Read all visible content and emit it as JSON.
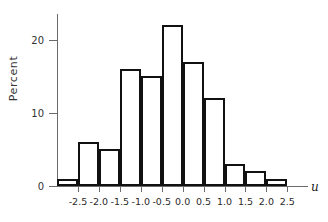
{
  "chart_data": {
    "type": "bar",
    "subtype": "histogram",
    "title": "",
    "xlabel": "u",
    "ylabel": "Percent",
    "categories": [
      "-2.75",
      "-2.25",
      "-1.75",
      "-1.25",
      "-0.75",
      "-0.25",
      "0.25",
      "0.75",
      "1.25",
      "1.75",
      "2.25"
    ],
    "bin_edges": [
      -3.0,
      -2.5,
      -2.0,
      -1.5,
      -1.0,
      -0.5,
      0.0,
      0.5,
      1.0,
      1.5,
      2.0,
      2.5
    ],
    "bin_width": 0.5,
    "values": [
      1,
      6,
      5,
      16,
      15,
      22,
      17,
      12,
      3,
      2,
      1
    ],
    "xlim": [
      -3.0,
      2.85
    ],
    "ylim": [
      0,
      23.5
    ],
    "grid": false,
    "legend": false,
    "xticks": [
      -2.5,
      -2.0,
      -1.5,
      -1.0,
      -0.5,
      0.0,
      0.5,
      1.0,
      1.5,
      2.0,
      2.5
    ],
    "xticklabels": [
      "-2.5",
      "-2.0",
      "-1.5",
      "-1.0",
      "-0.5",
      "0.0",
      "0.5",
      "1.0",
      "1.5",
      "2.0",
      "2.5"
    ],
    "yticks": [
      0,
      10,
      20
    ],
    "yticklabels": [
      "0",
      "10",
      "20"
    ],
    "bar_facecolor": "#ffffff",
    "bar_edgecolor": "#111111",
    "axis_color": "#6b6b6b",
    "background": "#ffffff"
  },
  "axes": {
    "y_title": "Percent",
    "x_title": "u"
  }
}
